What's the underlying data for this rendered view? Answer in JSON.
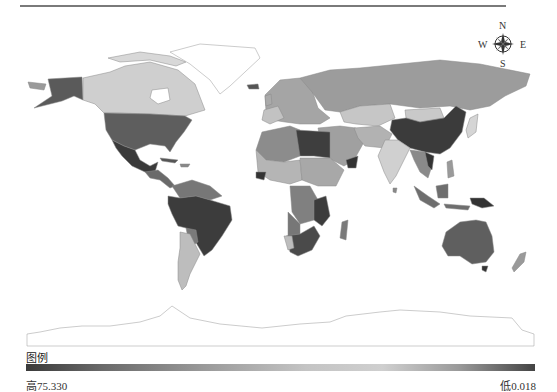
{
  "map": {
    "type": "choropleth",
    "projection": "world",
    "color_scheme": "grayscale",
    "regions": [
      {
        "name": "Alaska",
        "shade": "#5a5a5a"
      },
      {
        "name": "Canada",
        "shade": "#cfcfcf"
      },
      {
        "name": "Greenland",
        "shade": "#ffffff"
      },
      {
        "name": "United States",
        "shade": "#5e5e5e"
      },
      {
        "name": "Mexico",
        "shade": "#3a3a3a"
      },
      {
        "name": "Central America",
        "shade": "#6a6a6a"
      },
      {
        "name": "Northern South America",
        "shade": "#777777"
      },
      {
        "name": "Brazil",
        "shade": "#3c3c3c"
      },
      {
        "name": "Argentina",
        "shade": "#bdbdbd"
      },
      {
        "name": "Russia",
        "shade": "#9c9c9c"
      },
      {
        "name": "Europe",
        "shade": "#a5a5a5"
      },
      {
        "name": "Kazakhstan",
        "shade": "#c6c6c6"
      },
      {
        "name": "China",
        "shade": "#3b3b3b"
      },
      {
        "name": "India",
        "shade": "#d0d0d0"
      },
      {
        "name": "Middle East",
        "shade": "#a0a0a0"
      },
      {
        "name": "Libya/Egypt",
        "shade": "#3e3e3e"
      },
      {
        "name": "North Africa",
        "shade": "#8c8c8c"
      },
      {
        "name": "Central Africa",
        "shade": "#b0b0b0"
      },
      {
        "name": "Southern Africa",
        "shade": "#4a4a4a"
      },
      {
        "name": "Madagascar",
        "shade": "#7a7a7a"
      },
      {
        "name": "Southeast Asia",
        "shade": "#8a8a8a"
      },
      {
        "name": "Indonesia",
        "shade": "#6e6e6e"
      },
      {
        "name": "Papua New Guinea",
        "shade": "#333333"
      },
      {
        "name": "Australia",
        "shade": "#5f5f5f"
      },
      {
        "name": "New Zealand",
        "shade": "#9a9a9a"
      },
      {
        "name": "Antarctica",
        "shade": "#ffffff"
      }
    ]
  },
  "compass": {
    "north": "N",
    "south": "S",
    "east": "E",
    "west": "W"
  },
  "legend": {
    "title": "图例",
    "high_label": "高75.330",
    "low_label": "低0.018",
    "high_value": 75.33,
    "low_value": 0.018
  }
}
